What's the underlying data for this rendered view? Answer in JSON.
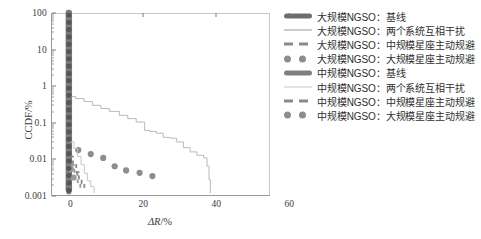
{
  "chart_data": {
    "type": "line",
    "title": "",
    "xlabel": "ΔR/%",
    "ylabel": "CCDF/%",
    "xlim": [
      -5,
      60
    ],
    "ylim": [
      0.001,
      100
    ],
    "yscale": "log",
    "xticks": [
      0,
      20,
      40,
      60
    ],
    "ytick_labels": [
      "100",
      "10",
      "1",
      "0.1",
      "0.01",
      "0.001"
    ],
    "ytick_values": [
      100,
      10,
      1,
      0.1,
      0.01,
      0.001
    ],
    "grid": false,
    "legend_position": "right",
    "series": [
      {
        "name": "大规模NGSO：基线",
        "style": "thick-line",
        "color": "#6e6e6e",
        "x": [
          0,
          0,
          0,
          0,
          0,
          0,
          0,
          0,
          0,
          0,
          0,
          0
        ],
        "y": [
          100,
          40,
          16,
          6,
          2.2,
          0.9,
          0.32,
          0.12,
          0.045,
          0.016,
          0.006,
          0.0015
        ]
      },
      {
        "name": "大规模NGSO：两个系统互相干扰",
        "style": "thin-line",
        "color": "#b9b9b9",
        "x": [
          0.4,
          2.0,
          4.5,
          7.0,
          9.5,
          12.0,
          15.0,
          17.5,
          20.0,
          22.5,
          24.0,
          26.0,
          28.0,
          30.0,
          32.0,
          34.0,
          36.0,
          38.0,
          40.0,
          41.0,
          41.6,
          42.0
        ],
        "y": [
          0.52,
          0.46,
          0.38,
          0.3,
          0.245,
          0.205,
          0.16,
          0.13,
          0.105,
          0.062,
          0.058,
          0.052,
          0.04,
          0.038,
          0.03,
          0.021,
          0.016,
          0.013,
          0.011,
          0.0065,
          0.0028,
          0.0012
        ]
      },
      {
        "name": "大规模NGSO：中规模星座主动规避",
        "style": "dashed-line",
        "color": "#8a8a8a",
        "x": [
          0.3,
          1.2,
          2.2,
          3.0,
          3.8,
          4.6
        ],
        "y": [
          0.012,
          0.0075,
          0.0045,
          0.003,
          0.0022,
          0.0016
        ]
      },
      {
        "name": "大规模NGSO：大规模星座主动规避",
        "style": "dots",
        "color": "#8d8d8d",
        "x": [
          2.8,
          6.5,
          10.2,
          13.6,
          17.0,
          21.0,
          24.8
        ],
        "y": [
          0.018,
          0.014,
          0.011,
          0.0065,
          0.005,
          0.0043,
          0.0035
        ]
      },
      {
        "name": "中规模NGSO：基线",
        "style": "thick-line",
        "color": "#7f7f7f",
        "x": [
          0,
          0,
          0,
          0,
          0,
          0
        ],
        "y": [
          100,
          10,
          1,
          0.1,
          0.01,
          0.0013
        ]
      },
      {
        "name": "中规模NGSO：两个系统互相干扰",
        "style": "thin-line",
        "color": "#c6c6c6",
        "x": [
          0.5,
          1.5,
          2.6,
          3.6,
          4.6,
          5.5,
          6.5,
          7.5
        ],
        "y": [
          0.03,
          0.02,
          0.012,
          0.0072,
          0.0042,
          0.0026,
          0.0018,
          0.0012
        ]
      },
      {
        "name": "中规模NGSO：中规模星座主动规避",
        "style": "dashed-line",
        "color": "#9a9a9a",
        "x": [
          0.6,
          1.6,
          2.6,
          3.4
        ],
        "y": [
          0.007,
          0.004,
          0.0024,
          0.0016
        ]
      },
      {
        "name": "中规模NGSO：大规模星座主动规避",
        "style": "dots",
        "color": "#9a9a9a",
        "x": [
          0.6,
          1.4
        ],
        "y": [
          0.0055,
          0.0032
        ]
      }
    ]
  },
  "legend": {
    "entries": [
      {
        "label": "大规模NGSO：基线",
        "key": "thick-line"
      },
      {
        "label": "大规模NGSO：两个系统互相干扰",
        "key": "thin-line"
      },
      {
        "label": "大规模NGSO：中规模星座主动规避",
        "key": "dashed-line"
      },
      {
        "label": "大规模NGSO：大规模星座主动规避",
        "key": "dots"
      },
      {
        "label": "中规模NGSO：基线",
        "key": "thick-line"
      },
      {
        "label": "中规模NGSO：两个系统互相干扰",
        "key": "thin-line-pale"
      },
      {
        "label": "中规模NGSO：中规模星座主动规避",
        "key": "dashed-line"
      },
      {
        "label": "中规模NGSO：大规模星座主动规避",
        "key": "dots"
      }
    ]
  },
  "axes": {
    "y_label": "CCDF/%",
    "x_label_symbol": "ΔR",
    "x_label_unit": "/%",
    "y_ticks": [
      "100",
      "10",
      "1",
      "0.1",
      "0.01",
      "0.001"
    ],
    "x_ticks": [
      "0",
      "20",
      "40",
      "60"
    ]
  },
  "colors": {
    "axis": "#9a9a9a",
    "baseline_dark": "#6e6e6e",
    "curve_light": "#bdbdbd",
    "marker": "#8d8d8d",
    "text": "#3a3a3a",
    "background": "#ffffff"
  }
}
